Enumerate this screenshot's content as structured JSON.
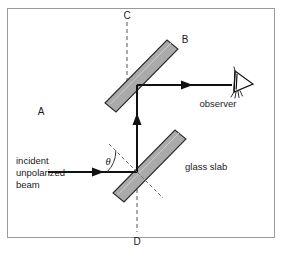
{
  "figure": {
    "background_color": "#ffffff",
    "frame_color": "#9a9a9a",
    "slab_fill": "#aaaaaa",
    "slab_stroke": "#2b2b2b",
    "beam_color": "#111111",
    "dash_color": "#555555"
  },
  "labels": {
    "point_a": "A",
    "point_b": "B",
    "point_c": "C",
    "point_d": "D",
    "theta": "θ",
    "observer": "observer",
    "glass_slab": "glass slab",
    "incident_line1": "incident",
    "incident_line2": "unpolarized",
    "incident_line3": "beam"
  },
  "icons": {
    "observer_eye": "eye-icon",
    "incident_beam_arrow": "arrow-right-icon",
    "reflected_beam_arrow": "arrow-up-icon",
    "output_beam_arrow": "arrow-right-icon"
  },
  "elements": {
    "upper_slab_name": "upper-glass-slab",
    "lower_slab_name": "lower-glass-slab",
    "normal_line_name": "normal-dashed-line",
    "axis_cd_name": "axis-cd-dashed-line",
    "angle_arc_name": "incidence-angle-arc"
  }
}
